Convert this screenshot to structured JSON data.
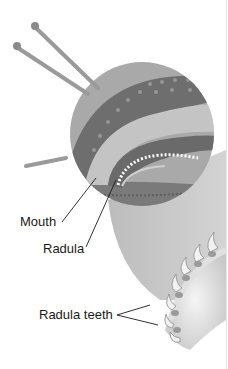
{
  "figure": {
    "labels": {
      "mouth": "Mouth",
      "radula": "Radula",
      "radula_teeth": "Radula teeth"
    }
  },
  "colors": {
    "background": "#ffffff",
    "circle_fill": "#a9a9a9",
    "body_dark": "#6e6e6e",
    "body_light": "#c4c4c4",
    "ground": "#7a7a7a",
    "zoom_cone": "#b8b8b8",
    "leader_line": "#1a1a1a"
  }
}
